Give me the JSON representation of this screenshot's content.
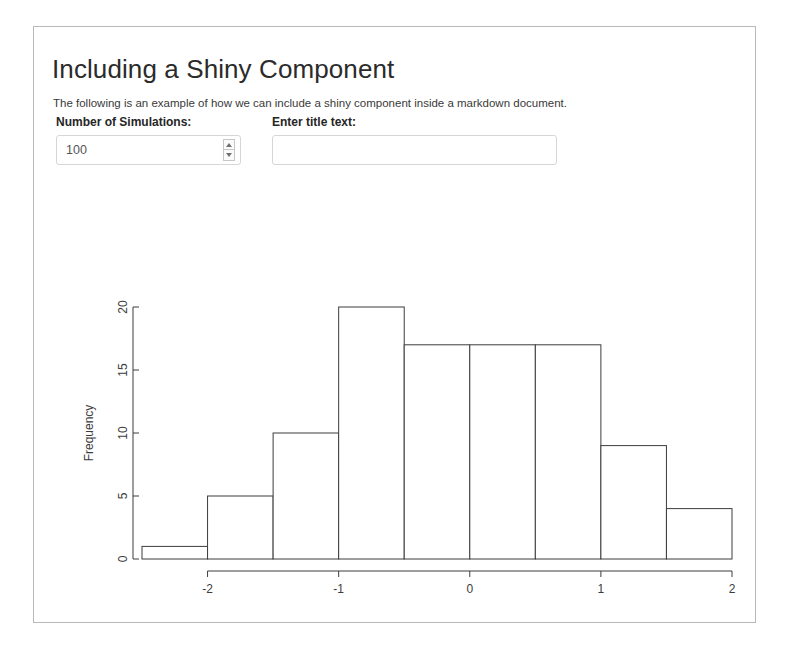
{
  "page": {
    "title": "Including a Shiny Component",
    "intro": "The following is an example of how we can include a shiny component inside a markdown document."
  },
  "controls": {
    "numeric": {
      "label": "Number of Simulations:",
      "value": "100",
      "placeholder": "",
      "spinner_up": "increment",
      "spinner_down": "decrement"
    },
    "title_text": {
      "label": "Enter title text:",
      "value": "",
      "placeholder": ""
    }
  },
  "chart_data": {
    "type": "bar",
    "title": "",
    "xlabel": "Simulated Data",
    "ylabel": "Frequency",
    "bin_width": 0.5,
    "bin_edges": [
      -2.5,
      -2.0,
      -1.5,
      -1.0,
      -0.5,
      0.0,
      0.5,
      1.0,
      1.5,
      2.0
    ],
    "categories": [
      "-2.5 to -2.0",
      "-2.0 to -1.5",
      "-1.5 to -1.0",
      "-1.0 to -0.5",
      "-0.5 to 0.0",
      "0.0 to 0.5",
      "0.5 to 1.0",
      "1.0 to 1.5",
      "1.5 to 2.0"
    ],
    "values": [
      1,
      5,
      10,
      20,
      17,
      17,
      17,
      9,
      4
    ],
    "xlim": [
      -2.5,
      2.0
    ],
    "ylim": [
      0,
      20
    ],
    "xticks": [
      -2,
      -1,
      0,
      1,
      2
    ],
    "xtick_labels": [
      "-2",
      "-1",
      "0",
      "1",
      "2"
    ],
    "yticks": [
      0,
      5,
      10,
      15,
      20
    ],
    "ytick_labels": [
      "0",
      "5",
      "10",
      "15",
      "20"
    ],
    "grid": false,
    "legend": false,
    "bar_fill": "#ffffff",
    "bar_stroke": "#3c3c3c"
  },
  "colors": {
    "panel_border": "#b9b9b9",
    "text": "#2b2b2b",
    "input_border": "#d6d6d6"
  }
}
